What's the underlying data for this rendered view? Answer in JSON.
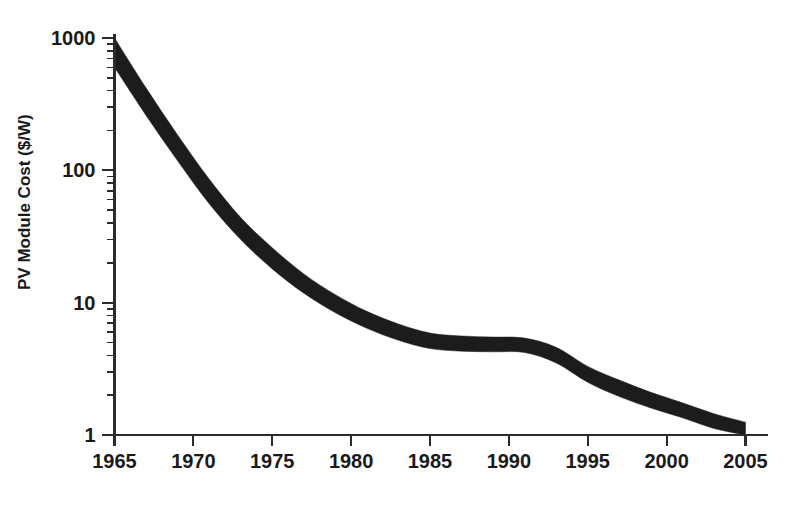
{
  "chart_data": {
    "type": "area",
    "title": "",
    "subtitle": "",
    "xlabel": "",
    "ylabel": "PV Module Cost ($/W)",
    "yscale": "log",
    "xscale": "linear",
    "xlim": [
      1965,
      2005
    ],
    "ylim": [
      1,
      1000
    ],
    "grid": false,
    "legend": null,
    "legend_position": "none",
    "x_tick_labels": [
      "1965",
      "1970",
      "1975",
      "1980",
      "1985",
      "1990",
      "1995",
      "2000",
      "2005"
    ],
    "x_ticks": [
      1965,
      1970,
      1975,
      1980,
      1985,
      1990,
      1995,
      2000,
      2005
    ],
    "y_tick_labels": [
      "1000",
      "100",
      "10",
      "1"
    ],
    "y_ticks": [
      1000,
      100,
      10,
      1
    ],
    "y_minor_ticks_per_decade": [
      2,
      3,
      4,
      5,
      6,
      7,
      8,
      9
    ],
    "band_color": "#1c1c1c",
    "axis_color": "#2b2b2b",
    "background_color": "#ffffff",
    "x": [
      1965,
      1967,
      1969,
      1971,
      1973,
      1975,
      1977,
      1979,
      1981,
      1983,
      1985,
      1987,
      1989,
      1991,
      1993,
      1995,
      1997,
      1999,
      2001,
      2003,
      2005
    ],
    "series": [
      {
        "name": "upper bound",
        "values": [
          1000,
          420,
          185,
          86,
          44,
          26,
          16.5,
          11.5,
          8.6,
          6.9,
          5.9,
          5.6,
          5.5,
          5.4,
          4.6,
          3.3,
          2.6,
          2.1,
          1.75,
          1.45,
          1.25
        ]
      },
      {
        "name": "lower bound",
        "values": [
          600,
          260,
          118,
          56,
          30,
          18,
          11.8,
          8.4,
          6.4,
          5.2,
          4.5,
          4.3,
          4.25,
          4.2,
          3.5,
          2.5,
          1.95,
          1.6,
          1.35,
          1.12,
          1.0
        ]
      }
    ]
  }
}
